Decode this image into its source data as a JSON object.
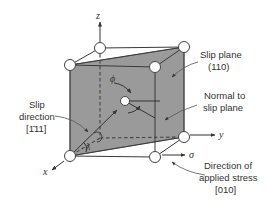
{
  "figure": {
    "type": "slip system geometry (cubic unit cell with slip plane)",
    "colors": {
      "plane_fill": "#9a9a9a",
      "edges": "#3a3a3a",
      "text": "#333333",
      "nodes": "#ffffff"
    }
  },
  "axes": {
    "z": "z",
    "y": "y",
    "x": "x",
    "sigma": "σ"
  },
  "angles": {
    "phi": "ϕ",
    "lambda": "λ"
  },
  "labels": {
    "slip_plane": {
      "line1": "Slip plane",
      "line2": "(110)"
    },
    "normal": {
      "line1": "Normal to",
      "line2": "slip plane"
    },
    "slip_direction": {
      "line1": "Slip",
      "line2": "direction",
      "line3": "[1̄11]"
    },
    "stress": {
      "line1": "Direction of",
      "line2": "applied stress",
      "line3": "[010]"
    }
  }
}
